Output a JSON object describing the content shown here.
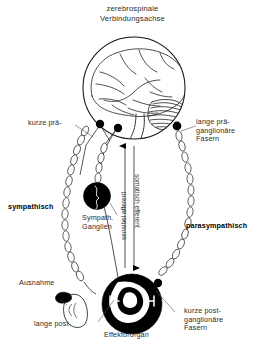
{
  "figure": {
    "title": "zerebrospinale\nVerbindungsachse",
    "background_color": "#ffffff",
    "ink_color": "#000000"
  },
  "labels": {
    "kurze_prae": "kurze prä-",
    "lange_prae": "lange prä-\nganglionäre\nFasern",
    "sympathisch": "sympathisch",
    "parasympathisch": "parasympathisch",
    "sympath_ganglien": "Sympath.\nGanglien",
    "ausnahme": "Ausnahme",
    "lange_post": "lange post-",
    "kurze_post": "kurze post-\nganglionäre\nFasern",
    "effektororgan": "Effektororgan",
    "sensibel_afferent": "sensibel afferent",
    "somatisch_efferent": "somatisch efferent"
  },
  "structures": {
    "head": "head-brain-circle",
    "cerebrum": "cerebrum",
    "cerebellum": "cerebellum-striated",
    "brainstem": "brainstem",
    "sympathetic_chain": "sympathetic-ganglion-chain",
    "parasympathetic_fiber": "parasympathetic-long-fiber",
    "ganglion": "sympathetic-ganglion-node",
    "effector": "effector-organ-circle",
    "adrenal": "adrenal-gland-exception"
  },
  "arrows": {
    "afferent_direction": "up",
    "efferent_direction": "down"
  }
}
